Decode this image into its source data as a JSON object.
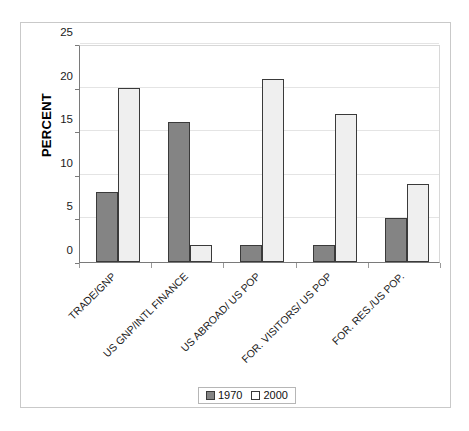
{
  "chart_data": {
    "type": "bar",
    "title": "",
    "subtitle": "",
    "xlabel": "",
    "ylabel": "PERCENT",
    "ylim": [
      0,
      25
    ],
    "ytick_values": [
      0,
      5,
      10,
      15,
      20,
      25
    ],
    "ytick_labels": [
      "0",
      "5",
      "10",
      "15",
      "20",
      "25"
    ],
    "grid": true,
    "grid_axis": "y",
    "legend_position": "bottom-center",
    "categories": [
      "TRADE/GNP",
      "US GNP/INTL FINANCE",
      "US ABROAD/ US POP",
      "FOR. VISITORS/ US POP",
      "FOR. RES./US POP."
    ],
    "series": [
      {
        "name": "1970",
        "color": "#848484",
        "values": [
          8,
          16,
          2,
          2,
          5
        ]
      },
      {
        "name": "2000",
        "color": "#efefef",
        "values": [
          20,
          2,
          21,
          17,
          9
        ]
      }
    ]
  },
  "legend": {
    "entries": [
      {
        "label": "1970",
        "swatch": "dark-gray-swatch"
      },
      {
        "label": "2000",
        "swatch": "white-swatch"
      }
    ]
  },
  "colors": {
    "series_1970": "#848484",
    "series_2000": "#efefef",
    "bar_outline": "#3a3a3a",
    "axis": "#7a7a7a",
    "gridline": "#e4e4e4",
    "frame": "#c9c9c9",
    "text": "#1a1a1a"
  }
}
